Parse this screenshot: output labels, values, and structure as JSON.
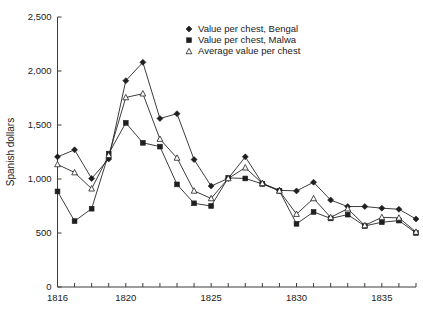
{
  "chart_data": {
    "type": "line",
    "title": "",
    "xlabel": "",
    "ylabel": "Spanish dollars",
    "xlim": [
      1816,
      1837
    ],
    "ylim": [
      0,
      2500
    ],
    "grid": false,
    "legend_position": "top-center",
    "x": [
      1816,
      1817,
      1818,
      1819,
      1820,
      1821,
      1822,
      1823,
      1824,
      1825,
      1826,
      1827,
      1828,
      1829,
      1830,
      1831,
      1832,
      1833,
      1834,
      1835,
      1836,
      1837
    ],
    "xticks": [
      1816,
      1820,
      1825,
      1830,
      1835
    ],
    "xticklabels": [
      "1816",
      "1820",
      "1825",
      "1830",
      "1835"
    ],
    "yticks": [
      0,
      500,
      1000,
      1500,
      2000,
      2500
    ],
    "yticklabels": [
      "0",
      "500",
      "1,000",
      "1,500",
      "2,000",
      "2,500"
    ],
    "series": [
      {
        "name": "Value per chest, Bengal",
        "marker": "diamond",
        "values": [
          1205,
          1270,
          1005,
          1185,
          1910,
          2080,
          1560,
          1605,
          1180,
          935,
          1005,
          1205,
          960,
          895,
          890,
          970,
          805,
          745,
          745,
          730,
          720,
          630
        ]
      },
      {
        "name": "Value per chest, Malwa",
        "marker": "square",
        "values": [
          885,
          610,
          725,
          1235,
          1520,
          1335,
          1300,
          950,
          775,
          750,
          1010,
          1005,
          955,
          890,
          585,
          695,
          635,
          670,
          565,
          600,
          615,
          500
        ]
      },
      {
        "name": "Average value per chest",
        "marker": "triangle",
        "values": [
          1135,
          1060,
          910,
          1220,
          1755,
          1790,
          1370,
          1195,
          890,
          820,
          1005,
          1105,
          960,
          890,
          675,
          820,
          645,
          725,
          570,
          645,
          640,
          510
        ]
      }
    ]
  },
  "legend": {
    "items": [
      {
        "label": "Value per chest, Bengal",
        "marker": "diamond"
      },
      {
        "label": "Value per chest, Malwa",
        "marker": "square"
      },
      {
        "label": "Average value per chest",
        "marker": "triangle"
      }
    ]
  },
  "axes": {
    "y_axis_title": "Spanish dollars"
  }
}
